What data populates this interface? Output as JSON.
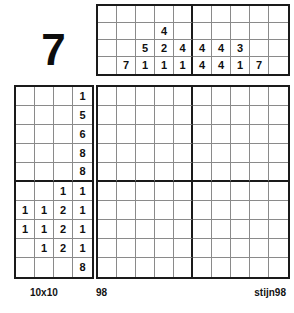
{
  "puzzle": {
    "number_display": "7",
    "size_label": "10x10",
    "id_label": "98",
    "author_label": "stijn98",
    "type": "nonogram",
    "grid_size": 10,
    "block_size": 5,
    "ink_color": "#1a1a1a",
    "cell_line_color": "#8a8a8a",
    "background_color": "#ffffff"
  },
  "column_clues_grid": {
    "rows": 4,
    "cols": 10,
    "cells": [
      [
        "",
        "",
        "",
        "",
        "",
        "",
        "",
        "",
        "",
        ""
      ],
      [
        "",
        "",
        "",
        "4",
        "",
        "",
        "",
        "",
        "",
        ""
      ],
      [
        "",
        "",
        "5",
        "2",
        "4",
        "4",
        "4",
        "3",
        "",
        ""
      ],
      [
        "",
        "7",
        "1",
        "1",
        "1",
        "4",
        "4",
        "1",
        "7",
        ""
      ]
    ]
  },
  "row_clues_grid": {
    "rows": 10,
    "cols": 4,
    "cells": [
      [
        "",
        "",
        "",
        "1"
      ],
      [
        "",
        "",
        "",
        "5"
      ],
      [
        "",
        "",
        "",
        "6"
      ],
      [
        "",
        "",
        "",
        "8"
      ],
      [
        "",
        "",
        "",
        "8"
      ],
      [
        "",
        "",
        "1",
        "1"
      ],
      [
        "1",
        "1",
        "2",
        "1"
      ],
      [
        "1",
        "1",
        "2",
        "1"
      ],
      [
        "",
        "1",
        "2",
        "1"
      ],
      [
        "",
        "",
        "",
        "8"
      ]
    ]
  },
  "column_clues_lists": [
    [],
    [
      7
    ],
    [
      5,
      1
    ],
    [
      4,
      2,
      1
    ],
    [
      4,
      1
    ],
    [
      4,
      4
    ],
    [
      4,
      4
    ],
    [
      3,
      1
    ],
    [
      7
    ],
    []
  ],
  "row_clues_lists": [
    [
      1
    ],
    [
      5
    ],
    [
      6
    ],
    [
      8
    ],
    [
      8
    ],
    [
      1,
      1
    ],
    [
      1,
      1,
      2,
      1
    ],
    [
      1,
      1,
      2,
      1
    ],
    [
      1,
      2,
      1
    ],
    [
      8
    ]
  ],
  "main_grid": {
    "rows": 10,
    "cols": 10,
    "cells": [
      [
        "",
        "",
        "",
        "",
        "",
        "",
        "",
        "",
        "",
        ""
      ],
      [
        "",
        "",
        "",
        "",
        "",
        "",
        "",
        "",
        "",
        ""
      ],
      [
        "",
        "",
        "",
        "",
        "",
        "",
        "",
        "",
        "",
        ""
      ],
      [
        "",
        "",
        "",
        "",
        "",
        "",
        "",
        "",
        "",
        ""
      ],
      [
        "",
        "",
        "",
        "",
        "",
        "",
        "",
        "",
        "",
        ""
      ],
      [
        "",
        "",
        "",
        "",
        "",
        "",
        "",
        "",
        "",
        ""
      ],
      [
        "",
        "",
        "",
        "",
        "",
        "",
        "",
        "",
        "",
        ""
      ],
      [
        "",
        "",
        "",
        "",
        "",
        "",
        "",
        "",
        "",
        ""
      ],
      [
        "",
        "",
        "",
        "",
        "",
        "",
        "",
        "",
        "",
        ""
      ],
      [
        "",
        "",
        "",
        "",
        "",
        "",
        "",
        "",
        "",
        ""
      ]
    ]
  }
}
